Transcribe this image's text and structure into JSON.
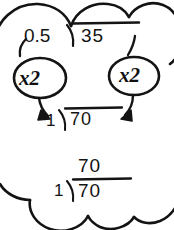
{
  "note": {
    "title": "Decimal divisor conversion",
    "frame_style": "cloud-thought-bubble",
    "ink_color": "#141414",
    "background_color": "#ffffff"
  },
  "top_problem": {
    "divisor": "0.5",
    "bracket": "long-division-bracket",
    "dividend": "35"
  },
  "annotations": {
    "left_bubble": {
      "label": "x2",
      "shape": "ellipse",
      "points_from": "0.5",
      "points_to": "1"
    },
    "right_bubble": {
      "label": "x2",
      "shape": "ellipse",
      "points_from": "35",
      "points_to": "70"
    }
  },
  "middle_problem": {
    "divisor": "1",
    "bracket": "long-division-bracket",
    "dividend": "70"
  },
  "bottom_problem": {
    "quotient": "70",
    "divisor": "1",
    "bracket": "long-division-bracket",
    "dividend": "70"
  }
}
